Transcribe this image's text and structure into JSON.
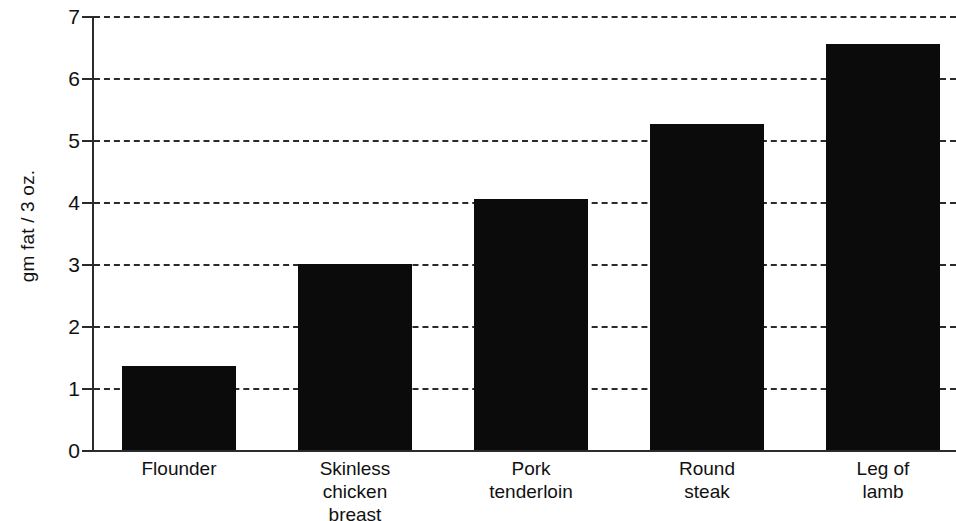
{
  "chart_data": {
    "type": "bar",
    "title": "",
    "xlabel": "",
    "ylabel": "gm fat / 3 oz.",
    "categories": [
      "Flounder",
      "Skinless chicken breast",
      "Pork tenderloin",
      "Round steak",
      "Leg of lamb"
    ],
    "category_lines": [
      [
        "Flounder"
      ],
      [
        "Skinless",
        "chicken",
        "breast"
      ],
      [
        "Pork",
        "tenderloin"
      ],
      [
        "Round",
        "steak"
      ],
      [
        "Leg of",
        "lamb"
      ]
    ],
    "values": [
      1.35,
      3.0,
      4.05,
      5.26,
      6.55
    ],
    "ylim": [
      0,
      7
    ],
    "yticks": [
      0,
      1,
      2,
      3,
      4,
      5,
      6,
      7
    ],
    "ytick_labels": [
      "0",
      "1",
      "2",
      "3",
      "4",
      "5",
      "6",
      "7"
    ],
    "grid": true,
    "grid_style": "dashed-horizontal",
    "legend": null,
    "bar_color": "#0b0b0b",
    "axis_color": "#2b2b2b",
    "background_color": "#ffffff"
  }
}
